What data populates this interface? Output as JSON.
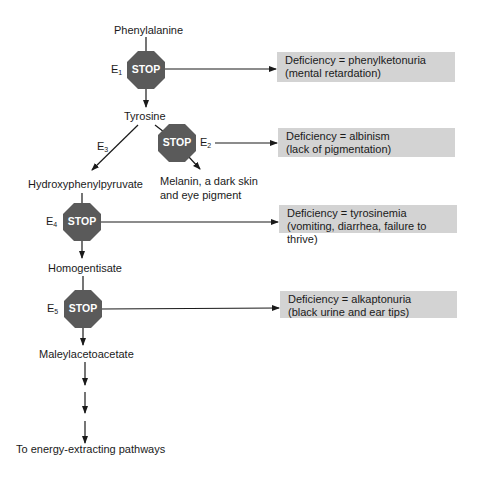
{
  "diagram": {
    "type": "metabolic-pathway",
    "colors": {
      "stop_sign": "#5a5a5a",
      "deficiency_box": "#d3d3d3",
      "line": "#1a1a1a"
    },
    "metabolites": [
      {
        "id": "phenylalanine",
        "label": "Phenylalanine"
      },
      {
        "id": "tyrosine",
        "label": "Tyrosine"
      },
      {
        "id": "hydroxyphenylpyruvate",
        "label": "Hydroxyphenylpyruvate"
      },
      {
        "id": "melanin",
        "label_line1": "Melanin, a dark skin",
        "label_line2": "and eye pigment"
      },
      {
        "id": "homogentisate",
        "label": "Homogentisate"
      },
      {
        "id": "maleylacetoacetate",
        "label": "Maleylacetoacetate"
      },
      {
        "id": "energy",
        "label": "To energy-extracting pathways"
      }
    ],
    "enzymes": [
      {
        "letter": "E",
        "sub": "1",
        "stop_label": "STOP"
      },
      {
        "letter": "E",
        "sub": "2",
        "stop_label": "STOP"
      },
      {
        "letter": "E",
        "sub": "3"
      },
      {
        "letter": "E",
        "sub": "4",
        "stop_label": "STOP"
      },
      {
        "letter": "E",
        "sub": "5",
        "stop_label": "STOP"
      }
    ],
    "deficiencies": [
      {
        "line1": "Deficiency = phenylketonuria",
        "line2": "(mental retardation)"
      },
      {
        "line1": "Deficiency = albinism",
        "line2": "(lack of pigmentation)"
      },
      {
        "line1": "Deficiency = tyrosinemia",
        "line2": "(vomiting, diarrhea, failure to thrive)"
      },
      {
        "line1": "Deficiency = alkaptonuria",
        "line2": "(black urine and ear tips)"
      }
    ]
  }
}
